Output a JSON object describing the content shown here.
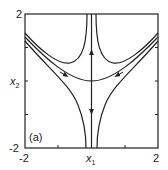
{
  "figure": {
    "panel_label": "(a)",
    "xlabel": "x",
    "xlabel_sub": "1",
    "ylabel": "x",
    "ylabel_sub": "2",
    "x_ticks": [
      "-2",
      "2"
    ],
    "y_ticks": [
      "2",
      "-2"
    ],
    "line_color": "#222222"
  }
}
